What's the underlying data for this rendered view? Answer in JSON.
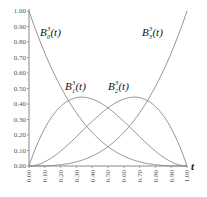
{
  "chart_data": {
    "type": "line",
    "title": "",
    "xlabel": "t",
    "ylabel": "",
    "xlim": [
      0,
      1
    ],
    "ylim": [
      0,
      1
    ],
    "grid": false,
    "legend": "inline labels",
    "x_ticks": [
      "0.00",
      "0.10",
      "0.20",
      "0.30",
      "0.40",
      "0.50",
      "0.60",
      "0.70",
      "0.80",
      "0.90",
      "1.00"
    ],
    "y_ticks": [
      "0.00",
      "0.10",
      "0.20",
      "0.30",
      "0.40",
      "0.50",
      "0.60",
      "0.70",
      "0.80",
      "0.90",
      "1.00"
    ],
    "x": [
      0.0,
      0.1,
      0.2,
      0.3,
      0.4,
      0.5,
      0.6,
      0.7,
      0.8,
      0.9,
      1.0
    ],
    "series": [
      {
        "name": "B_0^3(t)",
        "label_base": "B",
        "label_sub": "0",
        "label_sup": "3",
        "label_arg": "(t)",
        "values": [
          1.0,
          0.729,
          0.512,
          0.343,
          0.216,
          0.125,
          0.064,
          0.027,
          0.008,
          0.001,
          0.0
        ]
      },
      {
        "name": "B_1^3(t)",
        "label_base": "B",
        "label_sub": "1",
        "label_sup": "3",
        "label_arg": "(t)",
        "values": [
          0.0,
          0.243,
          0.384,
          0.441,
          0.432,
          0.375,
          0.288,
          0.189,
          0.096,
          0.027,
          0.0
        ]
      },
      {
        "name": "B_2^3(t)",
        "label_base": "B",
        "label_sub": "2",
        "label_sup": "3",
        "label_arg": "(t)",
        "values": [
          0.0,
          0.027,
          0.096,
          0.189,
          0.288,
          0.375,
          0.432,
          0.441,
          0.384,
          0.243,
          0.0
        ]
      },
      {
        "name": "B_3^3(t)",
        "label_base": "B",
        "label_sub": "3",
        "label_sup": "3",
        "label_arg": "(t)",
        "values": [
          0.0,
          0.001,
          0.008,
          0.027,
          0.064,
          0.125,
          0.216,
          0.343,
          0.512,
          0.729,
          1.0
        ]
      }
    ],
    "colors": {
      "curve": "#888888",
      "axis": "#888888"
    }
  }
}
